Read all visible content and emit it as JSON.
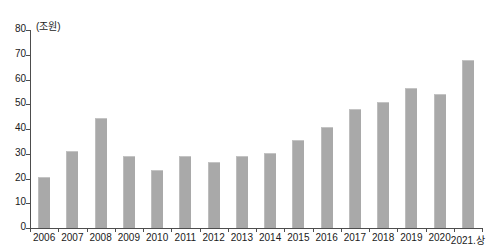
{
  "chart_data": {
    "type": "bar",
    "title": "",
    "subtitle": "",
    "xlabel": "",
    "ylabel": "",
    "unit_caption": "(조원)",
    "categories": [
      "2006",
      "2007",
      "2008",
      "2009",
      "2010",
      "2011",
      "2012",
      "2013",
      "2014",
      "2015",
      "2016",
      "2017",
      "2018",
      "2019",
      "2020",
      "2021.상"
    ],
    "values": [
      20.5,
      31,
      44.5,
      29,
      23.5,
      29,
      26.5,
      29,
      30.5,
      35.5,
      41,
      48,
      51,
      56.5,
      54,
      68
    ],
    "ylim": [
      0,
      80
    ],
    "yticks": [
      0,
      10,
      20,
      30,
      40,
      50,
      60,
      70,
      80
    ],
    "ytick_labels": [
      "0",
      "10",
      "20",
      "30",
      "40",
      "50",
      "60",
      "70",
      "80"
    ],
    "grid": false,
    "legend": null,
    "series": [
      {
        "name": "",
        "color": "#a9a9a9",
        "values": [
          20.5,
          31,
          44.5,
          29,
          23.5,
          29,
          26.5,
          29,
          30.5,
          35.5,
          41,
          48,
          51,
          56.5,
          54,
          68
        ]
      }
    ]
  }
}
